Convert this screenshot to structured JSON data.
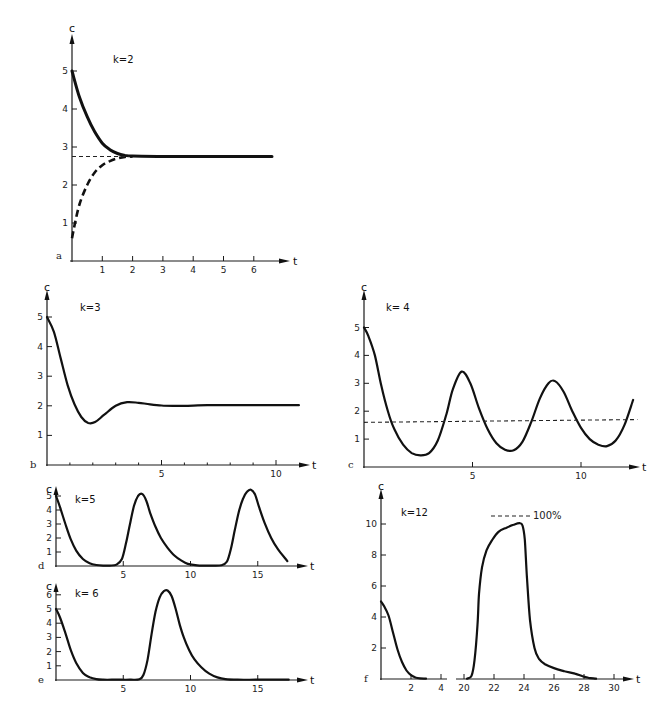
{
  "chart_data": [
    {
      "panel": "a",
      "type": "line",
      "title": "k=2",
      "xlabel": "t",
      "ylabel": "c",
      "xlim": [
        0,
        6.5
      ],
      "ylim": [
        0,
        5.5
      ],
      "xticks": [
        1,
        2,
        3,
        4,
        5,
        6
      ],
      "yticks": [
        1,
        2,
        3,
        4,
        5
      ],
      "grid": false,
      "equilibrium": 2.75,
      "series": [
        {
          "name": "from c0=5",
          "style": "solid-thick",
          "x": [
            0,
            0.25,
            0.5,
            0.75,
            1.0,
            1.25,
            1.5,
            1.75,
            2.0,
            3,
            4,
            5,
            6.6
          ],
          "y": [
            5.0,
            4.3,
            3.8,
            3.4,
            3.1,
            2.93,
            2.83,
            2.78,
            2.76,
            2.75,
            2.75,
            2.75,
            2.75
          ]
        },
        {
          "name": "from c0=0.6",
          "style": "dashed-thick",
          "x": [
            0,
            0.1,
            0.25,
            0.5,
            0.75,
            1.0,
            1.25,
            1.5,
            1.75,
            2.0
          ],
          "y": [
            0.6,
            1.0,
            1.5,
            2.0,
            2.33,
            2.52,
            2.63,
            2.7,
            2.74,
            2.75
          ]
        },
        {
          "name": "equilibrium",
          "style": "dashed-thin",
          "x": [
            0,
            1.9
          ],
          "y": [
            2.75,
            2.75
          ]
        }
      ]
    },
    {
      "panel": "b",
      "type": "line",
      "title": "k=3",
      "xlabel": "t",
      "ylabel": "c",
      "xlim": [
        0,
        11
      ],
      "ylim": [
        0,
        5.5
      ],
      "xticks": [
        5,
        10
      ],
      "xminor": [
        1,
        2,
        3,
        4,
        6,
        7,
        8,
        9
      ],
      "yticks": [
        1,
        2,
        3,
        4,
        5
      ],
      "grid": false,
      "series": [
        {
          "name": "c(t)",
          "style": "solid",
          "x": [
            0,
            0.3,
            0.6,
            0.9,
            1.2,
            1.5,
            1.8,
            2.1,
            2.5,
            3.0,
            3.5,
            4.0,
            4.5,
            5.0,
            5.5,
            6,
            7,
            8,
            9,
            10,
            11
          ],
          "y": [
            5.0,
            4.5,
            3.6,
            2.7,
            2.05,
            1.62,
            1.42,
            1.45,
            1.7,
            2.0,
            2.12,
            2.1,
            2.05,
            2.01,
            2.0,
            2.0,
            2.02,
            2.02,
            2.02,
            2.02,
            2.02
          ]
        }
      ]
    },
    {
      "panel": "c",
      "type": "line",
      "title": "k= 4",
      "xlabel": "t",
      "ylabel": "c",
      "xlim": [
        0,
        12.6
      ],
      "ylim": [
        0,
        5.5
      ],
      "xticks": [
        5,
        10
      ],
      "yticks": [
        1,
        2,
        3,
        4,
        5
      ],
      "grid": false,
      "equilibrium": 1.65,
      "series": [
        {
          "name": "c(t)",
          "style": "solid",
          "x": [
            0,
            0.2,
            0.5,
            0.8,
            1.1,
            1.4,
            1.8,
            2.2,
            2.6,
            3.0,
            3.4,
            3.8,
            4.1,
            4.5,
            4.9,
            5.3,
            5.7,
            6.1,
            6.5,
            6.9,
            7.3,
            7.7,
            8.1,
            8.5,
            8.8,
            9.2,
            9.6,
            10.0,
            10.4,
            10.8,
            11.2,
            11.6,
            12.0,
            12.4
          ],
          "y": [
            5.0,
            4.7,
            4.0,
            2.9,
            2.0,
            1.35,
            0.8,
            0.5,
            0.42,
            0.5,
            0.95,
            1.9,
            2.8,
            3.42,
            3.0,
            2.1,
            1.35,
            0.85,
            0.62,
            0.6,
            0.9,
            1.6,
            2.45,
            3.0,
            3.08,
            2.7,
            2.0,
            1.4,
            1.0,
            0.8,
            0.75,
            0.95,
            1.5,
            2.4
          ]
        },
        {
          "name": "equilibrium",
          "style": "dashed-thin",
          "x": [
            0,
            12.6
          ],
          "y": [
            1.6,
            1.7
          ]
        }
      ]
    },
    {
      "panel": "d",
      "type": "line",
      "title": "k=5",
      "xlabel": "t",
      "ylabel": "c",
      "xlim": [
        0,
        17.5
      ],
      "ylim": [
        0,
        5.5
      ],
      "xticks": [
        5,
        10,
        15
      ],
      "yticks": [
        1,
        2,
        3,
        4,
        5
      ],
      "grid": false,
      "series": [
        {
          "name": "c(t)",
          "style": "solid",
          "x": [
            0,
            0.3,
            0.7,
            1.1,
            1.5,
            2.0,
            2.5,
            3.0,
            3.5,
            4.0,
            4.5,
            4.9,
            5.2,
            5.5,
            5.8,
            6.1,
            6.4,
            6.7,
            7.0,
            7.4,
            7.8,
            8.3,
            8.8,
            9.3,
            9.8,
            10.5,
            11.5,
            12.3,
            12.7,
            13.0,
            13.3,
            13.6,
            13.9,
            14.2,
            14.5,
            14.8,
            15.1,
            15.5,
            16.0,
            16.5,
            17.2
          ],
          "y": [
            5.0,
            4.2,
            3.0,
            1.9,
            1.1,
            0.5,
            0.2,
            0.07,
            0.03,
            0.03,
            0.1,
            0.5,
            1.6,
            3.0,
            4.3,
            5.0,
            5.15,
            4.7,
            3.8,
            2.8,
            2.0,
            1.3,
            0.75,
            0.4,
            0.15,
            0.05,
            0.03,
            0.05,
            0.3,
            1.2,
            2.6,
            3.9,
            4.8,
            5.3,
            5.45,
            5.1,
            4.2,
            3.1,
            2.0,
            1.2,
            0.35
          ]
        }
      ]
    },
    {
      "panel": "e",
      "type": "line",
      "title": "k= 6",
      "xlabel": "t",
      "ylabel": "c",
      "xlim": [
        0,
        17.5
      ],
      "ylim": [
        0,
        6.8
      ],
      "xticks": [
        5,
        10,
        15
      ],
      "yticks": [
        1,
        2,
        3,
        4,
        5,
        6
      ],
      "grid": false,
      "series": [
        {
          "name": "c(t)",
          "style": "solid",
          "x": [
            0,
            0.3,
            0.7,
            1.1,
            1.5,
            2.0,
            2.5,
            3.0,
            3.5,
            4.5,
            5.5,
            6.2,
            6.5,
            6.8,
            7.1,
            7.4,
            7.7,
            8.0,
            8.3,
            8.6,
            8.9,
            9.2,
            9.5,
            9.9,
            10.3,
            10.8,
            11.4,
            12.0,
            12.6,
            13.5,
            15,
            17.3
          ],
          "y": [
            5.0,
            4.4,
            3.3,
            2.1,
            1.2,
            0.5,
            0.2,
            0.06,
            0.02,
            0.02,
            0.02,
            0.05,
            0.35,
            1.4,
            3.2,
            4.8,
            5.8,
            6.25,
            6.3,
            5.9,
            5.0,
            3.9,
            3.0,
            2.1,
            1.45,
            0.9,
            0.45,
            0.18,
            0.06,
            0.02,
            0.02,
            0.02
          ]
        }
      ]
    },
    {
      "panel": "f",
      "type": "line",
      "title": "k=12",
      "xlabel": "t",
      "ylabel": "c",
      "xlim_segments": [
        [
          0,
          4.3
        ],
        [
          19.6,
          31
        ]
      ],
      "ylim": [
        0,
        12
      ],
      "xticks": [
        2,
        4,
        20,
        22,
        24,
        26,
        28,
        30
      ],
      "yticks": [
        2,
        4,
        6,
        8,
        10
      ],
      "grid": false,
      "annotation": {
        "text": "100%",
        "y": 10.5,
        "x_from": 21.7,
        "x_to": 23.8
      },
      "series": [
        {
          "name": "c(t) early",
          "style": "solid",
          "segment": 0,
          "x": [
            0,
            0.2,
            0.5,
            0.8,
            1.1,
            1.4,
            1.7,
            2.0,
            2.3,
            2.6,
            3.0
          ],
          "y": [
            5.0,
            4.7,
            4.1,
            3.0,
            1.9,
            1.1,
            0.55,
            0.25,
            0.1,
            0.04,
            0.02
          ]
        },
        {
          "name": "c(t) late",
          "style": "solid",
          "segment": 1,
          "x": [
            20.2,
            20.5,
            20.7,
            20.9,
            21.0,
            21.2,
            21.5,
            21.9,
            22.3,
            22.8,
            23.3,
            23.7,
            23.9,
            24.05,
            24.2,
            24.4,
            24.7,
            25.0,
            25.4,
            26.0,
            26.7,
            27.4,
            27.9,
            28.3,
            28.8
          ],
          "y": [
            0.02,
            0.2,
            1.2,
            3.5,
            5.5,
            7.2,
            8.3,
            9.0,
            9.5,
            9.75,
            9.95,
            10.05,
            9.9,
            9.0,
            6.5,
            3.8,
            2.0,
            1.3,
            0.95,
            0.7,
            0.5,
            0.35,
            0.18,
            0.08,
            0.02
          ]
        }
      ]
    }
  ],
  "panels": {
    "a": {
      "letter": "a",
      "k_label": "k=2",
      "y_label": "c",
      "x_label": "t",
      "yt": [
        "1",
        "2",
        "3",
        "4",
        "5"
      ],
      "xt": [
        "1",
        "2",
        "3",
        "4",
        "5",
        "6"
      ]
    },
    "b": {
      "letter": "b",
      "k_label": "k=3",
      "y_label": "c",
      "x_label": "t",
      "yt": [
        "1",
        "2",
        "3",
        "4",
        "5"
      ],
      "xt": [
        "5",
        "10"
      ]
    },
    "c": {
      "letter": "c",
      "k_label": "k= 4",
      "y_label": "c",
      "x_label": "t",
      "yt": [
        "1",
        "2",
        "3",
        "4",
        "5"
      ],
      "xt": [
        "5",
        "10"
      ]
    },
    "d": {
      "letter": "d",
      "k_label": "k=5",
      "y_label": "c",
      "x_label": "t",
      "yt": [
        "1",
        "2",
        "3",
        "4",
        "5"
      ],
      "xt": [
        "5",
        "10",
        "15"
      ]
    },
    "e": {
      "letter": "e",
      "k_label": "k= 6",
      "y_label": "c",
      "x_label": "t",
      "yt": [
        "1",
        "2",
        "3",
        "4",
        "5",
        "6"
      ],
      "xt": [
        "5",
        "10",
        "15"
      ]
    },
    "f": {
      "letter": "f",
      "k_label": "k=12",
      "y_label": "c",
      "x_label": "t",
      "yt": [
        "2",
        "4",
        "6",
        "8",
        "10"
      ],
      "xt": [
        "2",
        "4",
        "20",
        "22",
        "24",
        "26",
        "28",
        "30"
      ],
      "annotation": "100%"
    }
  }
}
